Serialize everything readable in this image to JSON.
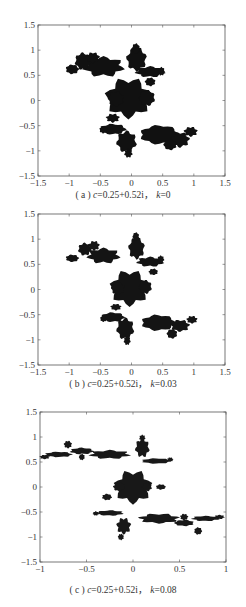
{
  "chart_data": [
    {
      "type": "scatter",
      "subtype": "filled-julia-set",
      "caption": {
        "prefix": "( a ) ",
        "c_label": "c",
        "c_value": "=0.25+0.52i， ",
        "k_label": "k",
        "k_value": "=0"
      },
      "caption_text": "(a) c=0.25+0.52i, k=0",
      "xlim": [
        -1.5,
        1.5
      ],
      "ylim": [
        -1.5,
        1.5
      ],
      "xticks": [
        -1.5,
        -1,
        -0.5,
        0,
        0.5,
        1,
        1.5
      ],
      "yticks": [
        -1.5,
        -1,
        -0.5,
        0,
        0.5,
        1,
        1.5
      ],
      "xtick_labels": [
        "−1.5",
        "−1",
        "−0.5",
        "0",
        "0.5",
        "1",
        "1.5"
      ],
      "ytick_labels": [
        "−1.5",
        "−1",
        "−0.5",
        "0",
        "0.5",
        "1",
        "1.5"
      ],
      "grid": false,
      "params": {
        "c": "0.25+0.52i",
        "k": 0
      },
      "fill_color": "#111111",
      "blobs": [
        [
          -0.05,
          0.05,
          0.33,
          0.36
        ],
        [
          -0.25,
          0.03,
          0.12,
          0.14
        ],
        [
          0.25,
          0.05,
          0.12,
          0.15
        ],
        [
          -0.45,
          0.67,
          0.3,
          0.18
        ],
        [
          -0.78,
          0.78,
          0.12,
          0.16
        ],
        [
          -0.95,
          0.62,
          0.1,
          0.09
        ],
        [
          -0.62,
          0.85,
          0.1,
          0.1
        ],
        [
          0.08,
          0.82,
          0.15,
          0.22
        ],
        [
          0.07,
          1.03,
          0.06,
          0.1
        ],
        [
          0.3,
          0.57,
          0.22,
          0.1
        ],
        [
          0.48,
          0.58,
          0.05,
          0.08
        ],
        [
          0.45,
          -0.68,
          0.3,
          0.18
        ],
        [
          0.78,
          -0.78,
          0.14,
          0.14
        ],
        [
          0.95,
          -0.62,
          0.1,
          0.09
        ],
        [
          0.62,
          -0.88,
          0.1,
          0.1
        ],
        [
          -0.08,
          -0.82,
          0.15,
          0.2
        ],
        [
          -0.05,
          -1.05,
          0.06,
          0.08
        ],
        [
          -0.3,
          -0.57,
          0.2,
          0.1
        ],
        [
          -0.45,
          -0.58,
          0.06,
          0.07
        ],
        [
          -0.3,
          -0.35,
          0.1,
          0.08
        ],
        [
          0.3,
          0.37,
          0.08,
          0.08
        ]
      ]
    },
    {
      "type": "scatter",
      "subtype": "filled-julia-set",
      "caption": {
        "prefix": "( b ) ",
        "c_label": "c",
        "c_value": "=0.25+0.52i， ",
        "k_label": "k",
        "k_value": "=0.03"
      },
      "caption_text": "(b) c=0.25+0.52i, k=0.03",
      "xlim": [
        -1.5,
        1.5
      ],
      "ylim": [
        -1.5,
        1.5
      ],
      "xticks": [
        -1.5,
        -1,
        -0.5,
        0,
        0.5,
        1,
        1.5
      ],
      "yticks": [
        -1.5,
        -1,
        -0.5,
        0,
        0.5,
        1,
        1.5
      ],
      "xtick_labels": [
        "−1.5",
        "−1",
        "−0.5",
        "0",
        "0.5",
        "1",
        "1.5"
      ],
      "ytick_labels": [
        "−1.5",
        "−1",
        "−0.5",
        "0",
        "0.5",
        "1",
        "1.5"
      ],
      "grid": false,
      "params": {
        "c": "0.25+0.52i",
        "k": 0.03
      },
      "fill_color": "#141414",
      "blobs": [
        [
          -0.03,
          0.03,
          0.28,
          0.32
        ],
        [
          -0.22,
          0.02,
          0.1,
          0.12
        ],
        [
          0.22,
          0.05,
          0.1,
          0.13
        ],
        [
          -0.45,
          0.67,
          0.24,
          0.14
        ],
        [
          -0.75,
          0.8,
          0.1,
          0.12
        ],
        [
          -0.95,
          0.62,
          0.1,
          0.07
        ],
        [
          -0.6,
          0.87,
          0.08,
          0.09
        ],
        [
          0.08,
          0.82,
          0.12,
          0.2
        ],
        [
          0.07,
          1.05,
          0.05,
          0.08
        ],
        [
          0.3,
          0.55,
          0.2,
          0.09
        ],
        [
          0.47,
          0.6,
          0.05,
          0.07
        ],
        [
          0.43,
          -0.66,
          0.26,
          0.15
        ],
        [
          0.78,
          -0.72,
          0.14,
          0.11
        ],
        [
          0.97,
          -0.6,
          0.08,
          0.07
        ],
        [
          0.65,
          -0.88,
          0.08,
          0.09
        ],
        [
          -0.1,
          -0.78,
          0.13,
          0.2
        ],
        [
          -0.07,
          -1.02,
          0.05,
          0.08
        ],
        [
          -0.3,
          -0.55,
          0.18,
          0.09
        ],
        [
          -0.45,
          -0.58,
          0.05,
          0.06
        ],
        [
          -0.25,
          -0.35,
          0.08,
          0.06
        ],
        [
          0.35,
          0.35,
          0.07,
          0.06
        ]
      ]
    },
    {
      "type": "scatter",
      "subtype": "filled-julia-set",
      "caption": {
        "prefix": "( c ) ",
        "c_label": "c",
        "c_value": "=0.25+0.52i， ",
        "k_label": "k",
        "k_value": "=0.08"
      },
      "caption_text": "(c) c=0.25+0.52i, k=0.08",
      "xlim": [
        -1,
        1
      ],
      "ylim": [
        -1.5,
        1.5
      ],
      "xticks": [
        -1,
        -0.5,
        0,
        0.5,
        1
      ],
      "yticks": [
        -1.5,
        -1,
        -0.5,
        0,
        0.5,
        1,
        1.5
      ],
      "xtick_labels": [
        "−1",
        "−0.5",
        "0",
        "0.5",
        "1"
      ],
      "ytick_labels": [
        "−1.5",
        "−1",
        "−0.5",
        "0",
        "0.5",
        "1",
        "1.5"
      ],
      "grid": false,
      "params": {
        "c": "0.25+0.52i",
        "k": 0.08
      },
      "fill_color": "#181818",
      "blobs": [
        [
          0.0,
          0.0,
          0.18,
          0.3
        ],
        [
          -0.15,
          0.0,
          0.06,
          0.08
        ],
        [
          0.15,
          0.0,
          0.05,
          0.08
        ],
        [
          -0.25,
          0.65,
          0.2,
          0.08
        ],
        [
          -0.55,
          0.72,
          0.12,
          0.06
        ],
        [
          -0.8,
          0.65,
          0.14,
          0.05
        ],
        [
          -0.95,
          0.6,
          0.05,
          0.04
        ],
        [
          -0.7,
          0.85,
          0.04,
          0.07
        ],
        [
          -0.55,
          0.6,
          0.03,
          0.06
        ],
        [
          0.1,
          0.78,
          0.07,
          0.17
        ],
        [
          0.1,
          0.98,
          0.03,
          0.06
        ],
        [
          0.25,
          0.52,
          0.15,
          0.05
        ],
        [
          0.4,
          0.55,
          0.03,
          0.04
        ],
        [
          0.28,
          -0.63,
          0.2,
          0.09
        ],
        [
          0.55,
          -0.72,
          0.1,
          0.06
        ],
        [
          0.78,
          -0.63,
          0.14,
          0.05
        ],
        [
          0.93,
          -0.6,
          0.05,
          0.04
        ],
        [
          0.7,
          -0.88,
          0.04,
          0.07
        ],
        [
          0.55,
          -0.6,
          0.04,
          0.06
        ],
        [
          -0.1,
          -0.78,
          0.07,
          0.15
        ],
        [
          -0.13,
          -1.0,
          0.03,
          0.06
        ],
        [
          -0.25,
          -0.52,
          0.14,
          0.05
        ],
        [
          -0.4,
          -0.53,
          0.03,
          0.04
        ],
        [
          -0.28,
          -0.2,
          0.05,
          0.06
        ],
        [
          0.3,
          0.0,
          0.05,
          0.05
        ]
      ]
    }
  ]
}
